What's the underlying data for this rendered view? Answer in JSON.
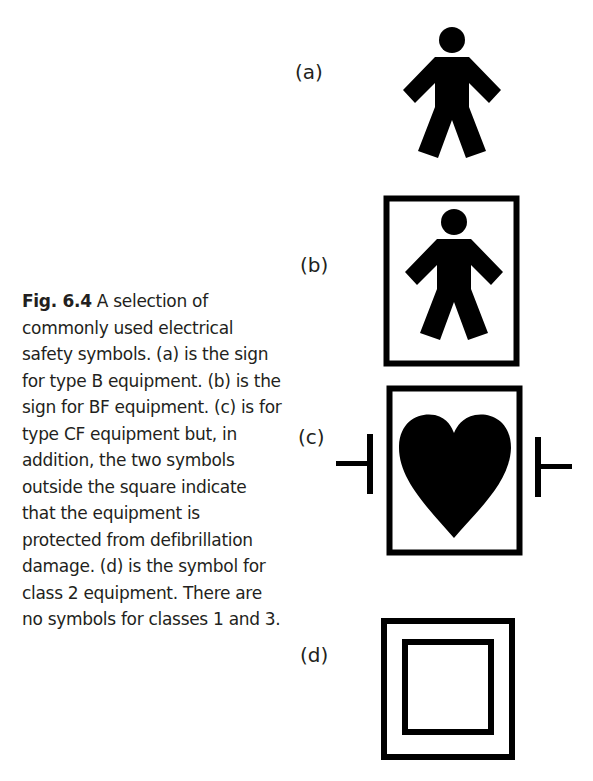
{
  "caption": {
    "figure_number": "Fig. 6.4",
    "text": " A selection of commonly used electrical safety symbols. (a) is the sign for type B equipment. (b) is the sign for BF equipment. (c) is for type CF equipment but, in addition, the two symbols outside the square indicate that the equipment is protected from defibrillation damage. (d) is the symbol for class 2 equipment. There are no symbols for classes 1 and 3."
  },
  "symbols": [
    {
      "label": "(a)",
      "icon": "type-b-person-icon",
      "meaning": "type B equipment"
    },
    {
      "label": "(b)",
      "icon": "type-bf-person-in-box-icon",
      "meaning": "BF equipment"
    },
    {
      "label": "(c)",
      "icon": "type-cf-defib-proof-heart-icon",
      "meaning": "type CF equipment, defibrillation-proof"
    },
    {
      "label": "(d)",
      "icon": "class-2-double-square-icon",
      "meaning": "class 2 equipment"
    }
  ]
}
